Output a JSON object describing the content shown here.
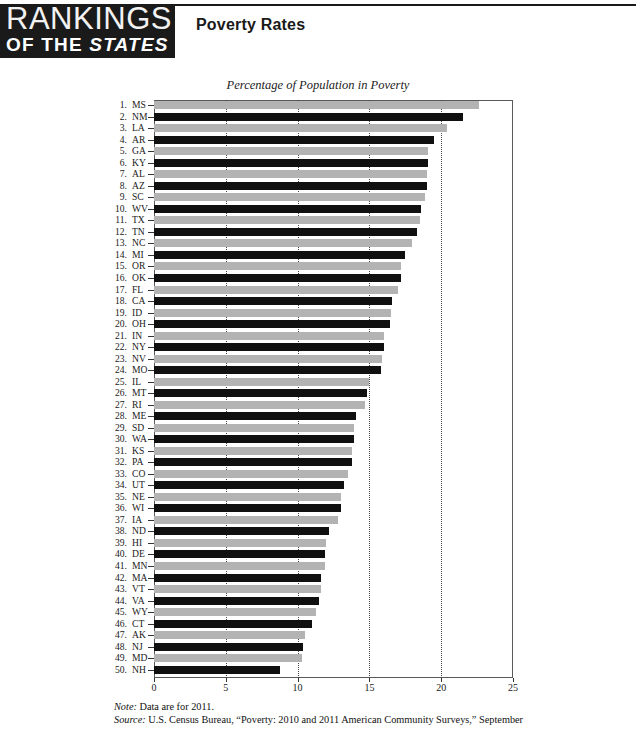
{
  "header": {
    "brand_line1": "RANKINGS",
    "brand_line2_a": "OF THE ",
    "brand_line2_b": "STATES",
    "title": "Poverty Rates"
  },
  "footnotes": {
    "note_label": "Note:",
    "note_text": " Data are for 2011.",
    "source_label": "Source:",
    "source_text": " U.S. Census Bureau, “Poverty: 2010 and 2011 American Community Surveys,” September"
  },
  "colors": {
    "bar_gray": "#b3b3b3",
    "bar_black": "#101010",
    "brand_bg": "#1a1a1a",
    "frame": "#5a5a5a"
  },
  "chart_data": {
    "type": "bar",
    "orientation": "horizontal",
    "title": "Percentage of Population in Poverty",
    "xlabel": "",
    "ylabel": "",
    "xlim": [
      0,
      25
    ],
    "xticks": [
      0,
      5,
      10,
      15,
      20,
      25
    ],
    "xtick_labels": [
      "0",
      "5",
      "10",
      "15",
      "20",
      "25"
    ],
    "grid": "vertical-dotted-at-xticks",
    "legend": "none",
    "categories": [
      "1.  MS",
      "2.  NM",
      "3.  LA",
      "4.  AR",
      "5.  GA",
      "6.  KY",
      "7.  AL",
      "8.  AZ",
      "9.  SC",
      "10.  WV",
      "11.  TX",
      "12.  TN",
      "13.  NC",
      "14.  MI",
      "15.  OR",
      "16.  OK",
      "17.  FL",
      "18.  CA",
      "19.  ID",
      "20.  OH",
      "21.  IN",
      "22.  NY",
      "23.  NV",
      "24.  MO",
      "25.  IL",
      "26.  MT",
      "27.  RI",
      "28.  ME",
      "29.  SD",
      "30.  WA",
      "31.  KS",
      "32.  PA",
      "33.  CO",
      "34.  UT",
      "35.  NE",
      "36.  WI",
      "37.  IA",
      "38.  ND",
      "39.  HI",
      "40.  DE",
      "41.  MN",
      "42.  MA",
      "43.  VT",
      "44.  VA",
      "45.  WY",
      "46.  CT",
      "47.  AK",
      "48.  NJ",
      "49.  MD",
      "50.  NH"
    ],
    "ranks": [
      1,
      2,
      3,
      4,
      5,
      6,
      7,
      8,
      9,
      10,
      11,
      12,
      13,
      14,
      15,
      16,
      17,
      18,
      19,
      20,
      21,
      22,
      23,
      24,
      25,
      26,
      27,
      28,
      29,
      30,
      31,
      32,
      33,
      34,
      35,
      36,
      37,
      38,
      39,
      40,
      41,
      42,
      43,
      44,
      45,
      46,
      47,
      48,
      49,
      50
    ],
    "states": [
      "MS",
      "NM",
      "LA",
      "AR",
      "GA",
      "KY",
      "AL",
      "AZ",
      "SC",
      "WV",
      "TX",
      "TN",
      "NC",
      "MI",
      "OR",
      "OK",
      "FL",
      "CA",
      "ID",
      "OH",
      "IN",
      "NY",
      "NV",
      "MO",
      "IL",
      "MT",
      "RI",
      "ME",
      "SD",
      "WA",
      "KS",
      "PA",
      "CO",
      "UT",
      "NE",
      "WI",
      "IA",
      "ND",
      "HI",
      "DE",
      "MN",
      "MA",
      "VT",
      "VA",
      "WY",
      "CT",
      "AK",
      "NJ",
      "MD",
      "NH"
    ],
    "values": [
      22.6,
      21.5,
      20.4,
      19.5,
      19.1,
      19.1,
      19.0,
      19.0,
      18.9,
      18.6,
      18.5,
      18.3,
      18.0,
      17.5,
      17.2,
      17.2,
      17.0,
      16.6,
      16.5,
      16.4,
      16.0,
      16.0,
      15.9,
      15.8,
      15.0,
      14.8,
      14.7,
      14.1,
      13.9,
      13.9,
      13.8,
      13.8,
      13.5,
      13.2,
      13.0,
      13.0,
      12.8,
      12.2,
      12.0,
      11.9,
      11.9,
      11.6,
      11.6,
      11.5,
      11.3,
      11.0,
      10.5,
      10.4,
      10.3,
      8.8
    ],
    "bar_colors": [
      "gray",
      "black",
      "gray",
      "black",
      "gray",
      "black",
      "gray",
      "black",
      "gray",
      "black",
      "gray",
      "black",
      "gray",
      "black",
      "gray",
      "black",
      "gray",
      "black",
      "gray",
      "black",
      "gray",
      "black",
      "gray",
      "black",
      "gray",
      "black",
      "gray",
      "black",
      "gray",
      "black",
      "gray",
      "black",
      "gray",
      "black",
      "gray",
      "black",
      "gray",
      "black",
      "gray",
      "black",
      "gray",
      "black",
      "gray",
      "black",
      "gray",
      "black",
      "gray",
      "black",
      "gray",
      "black"
    ]
  }
}
